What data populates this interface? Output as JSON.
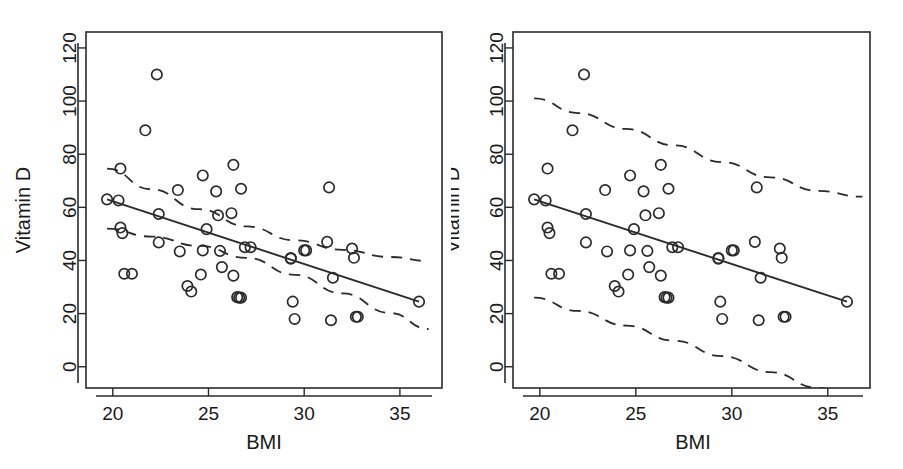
{
  "figure": {
    "background": "#ffffff",
    "ink_color": "#2b2b2b",
    "panel_count": 2
  },
  "chart_data": [
    {
      "type": "scatter",
      "panel": "left",
      "title": "",
      "xlabel": "BMI",
      "ylabel": "Vitamin D",
      "xlim": [
        18.6,
        37.2
      ],
      "ylim": [
        -8,
        126
      ],
      "xticks": [
        20,
        25,
        30,
        35
      ],
      "yticks": [
        0,
        20,
        40,
        60,
        80,
        100,
        120
      ],
      "xtick_labels": [
        "20",
        "25",
        "30",
        "35"
      ],
      "ytick_labels": [
        "0",
        "20",
        "40",
        "60",
        "80",
        "100",
        "120"
      ],
      "grid": false,
      "legend": "none",
      "marker": "open-circle",
      "x": [
        19.7,
        20.3,
        20.4,
        20.4,
        20.5,
        20.6,
        21.0,
        21.7,
        22.3,
        22.4,
        22.4,
        23.4,
        23.5,
        23.9,
        24.1,
        24.6,
        24.7,
        24.7,
        24.9,
        25.4,
        25.5,
        25.6,
        25.7,
        26.2,
        26.3,
        26.3,
        26.5,
        26.6,
        26.7,
        26.7,
        26.9,
        27.2,
        29.3,
        29.3,
        29.4,
        29.5,
        30.0,
        30.1,
        31.2,
        31.3,
        31.4,
        31.5,
        32.5,
        32.6,
        32.7,
        32.8,
        36.0
      ],
      "y": [
        63.0,
        62.6,
        74.6,
        52.4,
        50.3,
        35.0,
        35.0,
        89.0,
        110.0,
        57.5,
        46.8,
        66.5,
        43.4,
        30.4,
        28.3,
        34.7,
        72.0,
        43.8,
        51.8,
        66.0,
        57.0,
        43.6,
        37.5,
        57.8,
        76.0,
        34.3,
        26.2,
        26.0,
        26.0,
        67.0,
        45.0,
        45.0,
        40.9,
        40.7,
        24.5,
        18.0,
        43.8,
        43.8,
        47.0,
        67.5,
        17.5,
        33.5,
        44.5,
        41.0,
        18.8,
        18.8,
        24.5
      ],
      "fit_line": {
        "label": "least-squares regression line",
        "style": "solid",
        "x": [
          19.7,
          36.0
        ],
        "y": [
          63.0,
          24.5
        ],
        "slope": -2.362,
        "intercept": 109.5
      },
      "bands": {
        "label": "95% confidence interval for the mean",
        "style": "dashed",
        "x": [
          19.7,
          22.0,
          24.5,
          27.0,
          29.5,
          32.0,
          34.5,
          36.5
        ],
        "upper": [
          74.6,
          66.8,
          59.3,
          52.8,
          47.6,
          44.0,
          41.3,
          39.8
        ],
        "lower": [
          52.0,
          49.0,
          45.5,
          41.0,
          34.6,
          27.6,
          20.2,
          14.2
        ]
      }
    },
    {
      "type": "scatter",
      "panel": "right",
      "title": "",
      "xlabel": "BMI",
      "ylabel": "Vitamin D",
      "xlim": [
        18.6,
        37.2
      ],
      "ylim": [
        -8,
        126
      ],
      "xticks": [
        20,
        25,
        30,
        35
      ],
      "yticks": [
        0,
        20,
        40,
        60,
        80,
        100,
        120
      ],
      "xtick_labels": [
        "20",
        "25",
        "30",
        "35"
      ],
      "ytick_labels": [
        "0",
        "20",
        "40",
        "60",
        "80",
        "100",
        "120"
      ],
      "grid": false,
      "legend": "none",
      "marker": "open-circle",
      "x": [
        19.7,
        20.3,
        20.4,
        20.4,
        20.5,
        20.6,
        21.0,
        21.7,
        22.3,
        22.4,
        22.4,
        23.4,
        23.5,
        23.9,
        24.1,
        24.6,
        24.7,
        24.7,
        24.9,
        25.4,
        25.5,
        25.6,
        25.7,
        26.2,
        26.3,
        26.3,
        26.5,
        26.6,
        26.7,
        26.7,
        26.9,
        27.2,
        29.3,
        29.3,
        29.4,
        29.5,
        30.0,
        30.1,
        31.2,
        31.3,
        31.4,
        31.5,
        32.5,
        32.6,
        32.7,
        32.8,
        36.0
      ],
      "y": [
        63.0,
        62.6,
        74.6,
        52.4,
        50.3,
        35.0,
        35.0,
        89.0,
        110.0,
        57.5,
        46.8,
        66.5,
        43.4,
        30.4,
        28.3,
        34.7,
        72.0,
        43.8,
        51.8,
        66.0,
        57.0,
        43.6,
        37.5,
        57.8,
        76.0,
        34.3,
        26.2,
        26.0,
        26.0,
        67.0,
        45.0,
        45.0,
        40.9,
        40.7,
        24.5,
        18.0,
        43.8,
        43.8,
        47.0,
        67.5,
        17.5,
        33.5,
        44.5,
        41.0,
        18.8,
        18.8,
        24.5
      ],
      "fit_line": {
        "label": "least-squares regression line",
        "style": "solid",
        "x": [
          19.7,
          36.0
        ],
        "y": [
          63.0,
          24.5
        ],
        "slope": -2.362,
        "intercept": 109.5
      },
      "bands": {
        "label": "95% prediction interval for individual values",
        "style": "dashed",
        "x": [
          19.7,
          22.0,
          24.5,
          27.0,
          29.5,
          32.0,
          34.5,
          36.8
        ],
        "upper": [
          101.0,
          95.5,
          89.5,
          83.3,
          77.0,
          71.3,
          66.2,
          64.0
        ],
        "lower": [
          26.0,
          21.0,
          15.5,
          9.8,
          4.0,
          -2.0,
          -8.0,
          -13.0
        ]
      }
    }
  ],
  "panels": [
    {
      "id": "left",
      "x_axis_title": "BMI",
      "y_axis_title": "Vitamin D",
      "band_kind": "confidence"
    },
    {
      "id": "right",
      "x_axis_title": "BMI",
      "y_axis_title": "Vitamin D",
      "band_kind": "prediction"
    }
  ]
}
